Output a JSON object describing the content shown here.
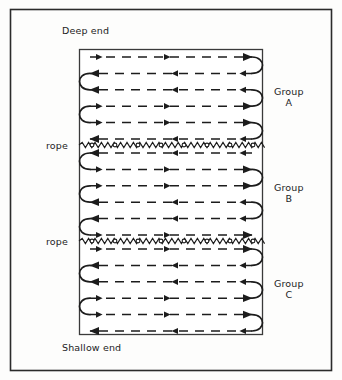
{
  "figure": {
    "labels": {
      "deep_end": "Deep end",
      "shallow_end": "Shallow end",
      "rope_1": "rope",
      "rope_2": "rope"
    },
    "colors": {
      "ink": "#1c1c1c",
      "background": "#fdfdfc",
      "border": "#2b2b2b",
      "lane": "#333333"
    },
    "groups": [
      {
        "id": "A",
        "name_line1": "Group",
        "name_line2": "A",
        "lane_count": 6,
        "first_lane_direction": "right"
      },
      {
        "id": "B",
        "name_line1": "Group",
        "name_line2": "B",
        "lane_count": 6,
        "first_lane_direction": "left"
      },
      {
        "id": "C",
        "name_line1": "Group",
        "name_line2": "C",
        "lane_count": 6,
        "first_lane_direction": "right"
      }
    ],
    "pool": {
      "outer_border": {
        "x": 10,
        "y": 9,
        "width": 322,
        "height": 362
      },
      "inner_rect": {
        "x": 79,
        "y": 49,
        "width": 184,
        "height": 286
      },
      "rope_y": [
        145,
        241
      ]
    }
  },
  "chart_data": {
    "type": "diagram",
    "sections": [
      {
        "label": "Group A",
        "lanes": 6,
        "lane_directions": [
          "right",
          "left",
          "left",
          "right",
          "right",
          "left"
        ],
        "turn_sides": [
          "right",
          "left",
          "right",
          "left",
          "right"
        ]
      },
      {
        "label": "Group B",
        "lanes": 6,
        "lane_directions": [
          "left",
          "right",
          "right",
          "left",
          "left",
          "right"
        ],
        "turn_sides": [
          "left",
          "right",
          "left",
          "right",
          "left"
        ]
      },
      {
        "label": "Group C",
        "lanes": 6,
        "lane_directions": [
          "right",
          "left",
          "left",
          "right",
          "right",
          "left"
        ],
        "turn_sides": [
          "right",
          "left",
          "right",
          "left",
          "right"
        ]
      }
    ],
    "dividers": [
      {
        "label": "rope",
        "y": 145
      },
      {
        "label": "rope",
        "y": 241
      }
    ],
    "ends": {
      "top": "Deep end",
      "bottom": "Shallow end"
    }
  }
}
